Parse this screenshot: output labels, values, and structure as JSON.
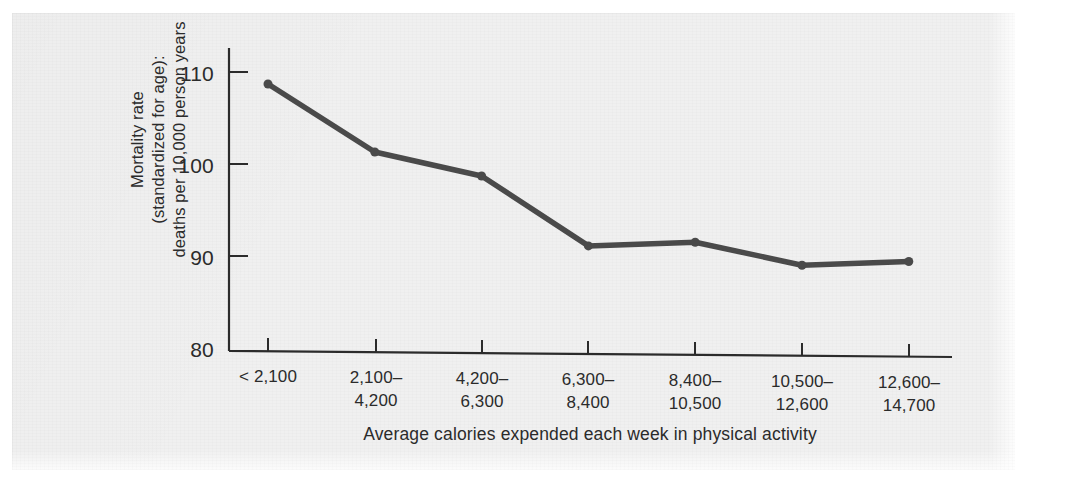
{
  "chart_data": {
    "type": "line",
    "title": "",
    "subtitle": "",
    "xlabel": "Average calories expended each week in physical activity",
    "ylabel": "Mortality rate (standardized for age): deaths per 10,000 person years",
    "ylabel_lines": [
      "Mortality rate",
      "(standardized for age):",
      "deaths per 10,000 person years"
    ],
    "categories": [
      "< 2,100",
      "2,100–4,200",
      "4,200–6,300",
      "6,300–8,400",
      "8,400–10,500",
      "10,500–12,600",
      "12,600–14,700"
    ],
    "category_lines": [
      [
        "< 2,100",
        ""
      ],
      [
        "2,100–",
        "4,200"
      ],
      [
        "4,200–",
        "6,300"
      ],
      [
        "6,300–",
        "8,400"
      ],
      [
        "8,400–",
        "10,500"
      ],
      [
        "10,500–",
        "12,600"
      ],
      [
        "12,600–",
        "14,700"
      ]
    ],
    "values": [
      108.7,
      101.3,
      98.7,
      91.1,
      91.5,
      89.0,
      89.4
    ],
    "ylim": [
      80,
      113
    ],
    "yticks": [
      80,
      90,
      100,
      110
    ],
    "ytick_labels": [
      "80",
      "90",
      "100",
      "110"
    ],
    "xlim_categories": 7,
    "grid": false,
    "legend": null,
    "series_color": "#4a4a4a",
    "marker": "circle",
    "marker_size": 9
  },
  "figure": {
    "background_color": "#f0f0f0",
    "axis_color": "#2b2b2b",
    "text_color": "#2b2b2b"
  }
}
